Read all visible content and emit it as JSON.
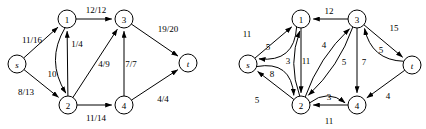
{
  "figure": {
    "type": "flow-network-diagram",
    "panel_count": 2,
    "background": "#ffffff",
    "stroke_color": "#000000",
    "node_radius": 9
  },
  "panels": [
    {
      "id": "left-panel",
      "name": "flow-network",
      "label_format": "flow/capacity",
      "nodes": [
        {
          "id": "s",
          "label": "s",
          "italic": true,
          "x": 17,
          "y": 64
        },
        {
          "id": "1",
          "label": "1",
          "italic": false,
          "x": 67,
          "y": 19
        },
        {
          "id": "3",
          "label": "3",
          "italic": false,
          "x": 124,
          "y": 19
        },
        {
          "id": "t",
          "label": "t",
          "italic": true,
          "x": 188,
          "y": 63
        },
        {
          "id": "2",
          "label": "2",
          "italic": false,
          "x": 68,
          "y": 105
        },
        {
          "id": "4",
          "label": "4",
          "italic": false,
          "x": 124,
          "y": 105
        }
      ],
      "edges": [
        {
          "from": "s",
          "to": "1",
          "label": "11/16",
          "flow": 11,
          "capacity": 16,
          "label_x": 32,
          "label_y": 40,
          "curve": 0
        },
        {
          "from": "s",
          "to": "2",
          "label": "8/13",
          "flow": 8,
          "capacity": 13,
          "label_x": 26,
          "label_y": 92,
          "curve": 0
        },
        {
          "from": "1",
          "to": "3",
          "label": "12/12",
          "flow": 12,
          "capacity": 12,
          "label_x": 96,
          "label_y": 10,
          "curve": 0
        },
        {
          "from": "1",
          "to": "2",
          "label": "10",
          "flow": 10,
          "capacity": null,
          "label_x": 52,
          "label_y": 74,
          "curve": 10
        },
        {
          "from": "2",
          "to": "1",
          "label": "1/4",
          "flow": 1,
          "capacity": 4,
          "label_x": 77,
          "label_y": 44,
          "curve": 0
        },
        {
          "from": "2",
          "to": "3",
          "label": "4/9",
          "flow": 4,
          "capacity": 9,
          "label_x": 104,
          "label_y": 64,
          "curve": 0
        },
        {
          "from": "2",
          "to": "4",
          "label": "11/14",
          "flow": 11,
          "capacity": 14,
          "label_x": 96,
          "label_y": 118,
          "curve": 0
        },
        {
          "from": "4",
          "to": "3",
          "label": "7/7",
          "flow": 7,
          "capacity": 7,
          "label_x": 131,
          "label_y": 64,
          "curve": 0
        },
        {
          "from": "3",
          "to": "t",
          "label": "19/20",
          "flow": 19,
          "capacity": 20,
          "label_x": 168,
          "label_y": 29,
          "curve": 0
        },
        {
          "from": "4",
          "to": "t",
          "label": "4/4",
          "flow": 4,
          "capacity": 4,
          "label_x": 163,
          "label_y": 99,
          "curve": 0
        }
      ]
    },
    {
      "id": "right-panel",
      "name": "residual-network",
      "label_format": "residual-capacity",
      "nodes": [
        {
          "id": "s",
          "label": "s",
          "italic": true,
          "x": 248,
          "y": 64
        },
        {
          "id": "1",
          "label": "1",
          "italic": false,
          "x": 301,
          "y": 19
        },
        {
          "id": "3",
          "label": "3",
          "italic": false,
          "x": 357,
          "y": 19
        },
        {
          "id": "t",
          "label": "t",
          "italic": true,
          "x": 412,
          "y": 65
        },
        {
          "id": "2",
          "label": "2",
          "italic": false,
          "x": 301,
          "y": 105
        },
        {
          "id": "4",
          "label": "4",
          "italic": false,
          "x": 357,
          "y": 105
        }
      ],
      "edges": [
        {
          "from": "1",
          "to": "s",
          "label": "11",
          "capacity": 11,
          "label_x": 247,
          "label_y": 34,
          "curve": -13
        },
        {
          "from": "s",
          "to": "1",
          "label": "5",
          "capacity": 5,
          "label_x": 268,
          "label_y": 47,
          "curve": 0
        },
        {
          "from": "s",
          "to": "2",
          "label": "5",
          "capacity": 5,
          "label_x": 257,
          "label_y": 100,
          "curve": -13
        },
        {
          "from": "2",
          "to": "s",
          "label": "8",
          "capacity": 8,
          "label_x": 272,
          "label_y": 74,
          "curve": 0
        },
        {
          "from": "3",
          "to": "1",
          "label": "12",
          "capacity": 12,
          "label_x": 329,
          "label_y": 11,
          "curve": 0
        },
        {
          "from": "2",
          "to": "1",
          "label": "3",
          "capacity": 3,
          "label_x": 288,
          "label_y": 61,
          "curve": -6
        },
        {
          "from": "1",
          "to": "2",
          "label": "11",
          "capacity": 11,
          "label_x": 306,
          "label_y": 61,
          "curve": 0
        },
        {
          "from": "2",
          "to": "3",
          "label": "4",
          "capacity": 4,
          "label_x": 324,
          "label_y": 45,
          "curve": -5
        },
        {
          "from": "3",
          "to": "2",
          "label": "5",
          "capacity": 5,
          "label_x": 344,
          "label_y": 62,
          "curve": -5
        },
        {
          "from": "3",
          "to": "4",
          "label": "7",
          "capacity": 7,
          "label_x": 364,
          "label_y": 62,
          "curve": 0
        },
        {
          "from": "4",
          "to": "2",
          "label": "3",
          "capacity": 3,
          "label_x": 329,
          "label_y": 97,
          "curve": 0
        },
        {
          "from": "2",
          "to": "4",
          "label": "11",
          "capacity": 11,
          "label_x": 329,
          "label_y": 121,
          "curve": -7
        },
        {
          "from": "t",
          "to": "3",
          "label": "15",
          "capacity": 15,
          "label_x": 394,
          "label_y": 28,
          "curve": -10
        },
        {
          "from": "3",
          "to": "t",
          "label": "5",
          "capacity": 5,
          "label_x": 381,
          "label_y": 50,
          "curve": 0
        },
        {
          "from": "t",
          "to": "4",
          "label": "4",
          "capacity": 4,
          "label_x": 388,
          "label_y": 96,
          "curve": 0
        }
      ]
    }
  ]
}
